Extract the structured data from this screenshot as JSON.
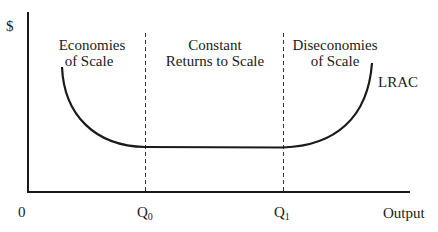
{
  "diagram": {
    "y_axis_label": "$",
    "x_axis_label": "Output",
    "origin_label": "0",
    "x_ticks": [
      {
        "label": "Q",
        "subscript": "0"
      },
      {
        "label": "Q",
        "subscript": "1"
      }
    ],
    "regions": [
      {
        "line1": "Economies",
        "line2": "of Scale"
      },
      {
        "line1": "Constant",
        "line2": "Returns to Scale"
      },
      {
        "line1": "Diseconomies",
        "line2": "of Scale"
      }
    ],
    "curve_label": "LRAC",
    "colors": {
      "line": "#1a1a1a",
      "background": "#ffffff"
    }
  }
}
